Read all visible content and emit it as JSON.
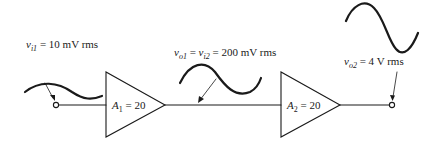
{
  "diagram": {
    "input_label": {
      "var": "v",
      "sub": "i1",
      "eq": " = ",
      "value": "10 mV rms"
    },
    "mid_label": {
      "var1": "v",
      "sub1": "o1",
      "eq1": " = ",
      "var2": "v",
      "sub2": "i2",
      "eq2": " = ",
      "value": "200 mV rms"
    },
    "output_label": {
      "var": "v",
      "sub": "o2",
      "eq": " = ",
      "value": "4 V rms"
    },
    "amplifiers": [
      {
        "name": "A",
        "sub": "1",
        "eq": " = ",
        "gain": "20"
      },
      {
        "name": "A",
        "sub": "2",
        "eq": " = ",
        "gain": "20"
      }
    ],
    "colors": {
      "stroke": "#1a1a1a",
      "background": "#ffffff"
    }
  }
}
